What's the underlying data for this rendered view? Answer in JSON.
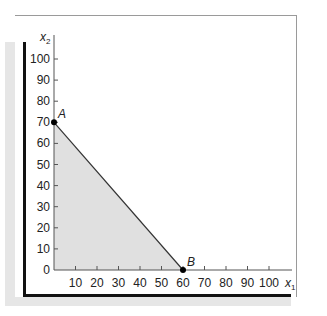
{
  "chart_data": {
    "type": "area",
    "title": "",
    "xlabel": "x1",
    "ylabel": "x2",
    "xlabel_main": "x",
    "xlabel_sub": "1",
    "ylabel_main": "x",
    "ylabel_sub": "2",
    "xlim": [
      0,
      108
    ],
    "ylim": [
      0,
      108
    ],
    "x_ticks": [
      10,
      20,
      30,
      40,
      50,
      60,
      70,
      80,
      90,
      100
    ],
    "y_ticks": [
      0,
      10,
      20,
      30,
      40,
      50,
      60,
      70,
      80,
      90,
      100
    ],
    "grid": false,
    "legend": null,
    "series": [
      {
        "name": "feasible region",
        "type": "polygon",
        "points": [
          [
            0,
            0
          ],
          [
            0,
            70
          ],
          [
            60,
            0
          ]
        ],
        "fill": "#e0e0e0",
        "stroke": "#333333"
      }
    ],
    "points": [
      {
        "label": "A",
        "x": 0,
        "y": 70
      },
      {
        "label": "B",
        "x": 60,
        "y": 0
      }
    ],
    "colors": {
      "region_fill": "#e0e0e0",
      "line": "#333333",
      "axis": "#555555",
      "frame_dark": "#111111",
      "frame_light": "#9a9a9a",
      "shadow": "#e6e6e6"
    }
  }
}
